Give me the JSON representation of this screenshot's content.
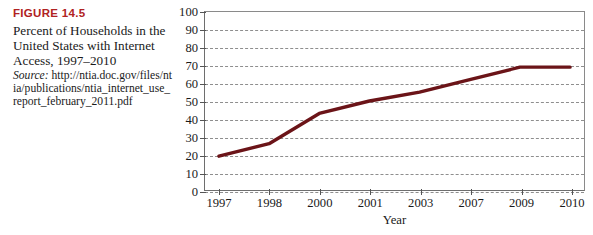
{
  "figure": {
    "number_label": "FIGURE 14.5",
    "title": "Percent of Households in the United States with Internet Access, 1997–2010",
    "source_label": "Source:",
    "source_url": "http://ntia.doc.gov/files/ntia/publications/ntia_internet_use_report_february_2011.pdf"
  },
  "colors": {
    "figure_number": "#b02222",
    "line": "#6b1418",
    "grid": "#8e8e8e",
    "axis": "#6e6e6e",
    "text": "#1a1a1a"
  },
  "chart_data": {
    "type": "line",
    "title": "",
    "xlabel": "Year",
    "ylabel": "",
    "categories": [
      "1997",
      "1998",
      "2000",
      "2001",
      "2003",
      "2007",
      "2009",
      "2010"
    ],
    "values": [
      19,
      26,
      43,
      50,
      55,
      62,
      69,
      69
    ],
    "series": [
      {
        "name": "Percent of Households with Internet Access",
        "values": [
          19,
          26,
          43,
          50,
          55,
          62,
          69,
          69
        ]
      }
    ],
    "yticks": [
      0,
      10,
      20,
      30,
      40,
      50,
      60,
      70,
      80,
      90,
      100
    ],
    "ytick_labels": [
      "0",
      "10",
      "20",
      "30",
      "40",
      "50",
      "60",
      "70",
      "80",
      "90",
      "100"
    ],
    "ylim": [
      0,
      100
    ],
    "grid": "horizontal-dashed",
    "legend": "none"
  }
}
